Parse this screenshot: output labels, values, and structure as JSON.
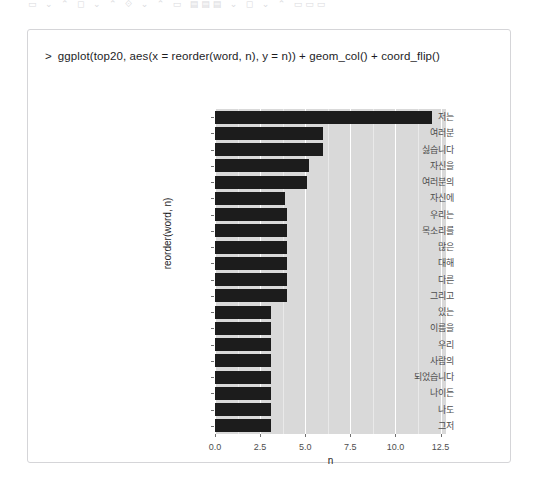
{
  "top_strip": {
    "faint_text": "▭  ⌄  ⌃  ◻  ⌄  ⌃  ⟐  ⌄  ⌃  ▭  ▤▤▤  ⌄  ◻  ⌄  ⌃  ▭▭▭"
  },
  "console": {
    "prompt": ">",
    "command": "ggplot(top20, aes(x = reorder(word, n), y = n)) + geom_col() + coord_flip()"
  },
  "chart_data": {
    "type": "bar",
    "orientation": "horizontal",
    "title": "",
    "xlabel": "n",
    "ylabel": "reorder(word, n)",
    "xlim": [
      0,
      12.8
    ],
    "xticks": [
      "0.0",
      "2.5",
      "5.0",
      "7.5",
      "10.0",
      "12.5"
    ],
    "xtick_values": [
      0,
      2.5,
      5,
      7.5,
      10,
      12.5
    ],
    "minor_xtick_values": [
      1.25,
      3.75,
      6.25,
      8.75,
      11.25
    ],
    "grid": true,
    "panel_bg": "#d9d9d9",
    "bar_color": "#1c1c1c",
    "categories": [
      "저는",
      "여러분",
      "싫습니다",
      "자신을",
      "여러분의",
      "자신에",
      "우리는",
      "목소리를",
      "많은",
      "대해",
      "다른",
      "그리고",
      "있는",
      "이름을",
      "우리",
      "사람의",
      "되었습니다",
      "나이든",
      "나도",
      "그저"
    ],
    "values": [
      12,
      6,
      6,
      5.2,
      5.1,
      3.9,
      4,
      4,
      4,
      4,
      4,
      4,
      3.1,
      3.1,
      3.1,
      3.1,
      3.1,
      3.1,
      3.1,
      3.1
    ]
  }
}
